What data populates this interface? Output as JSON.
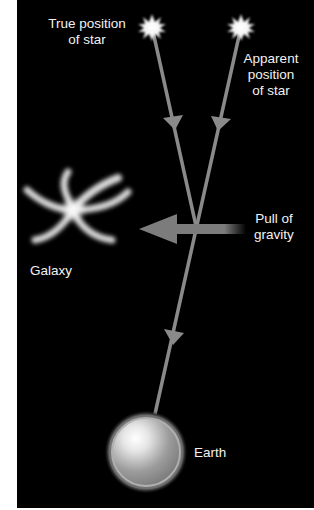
{
  "diagram": {
    "labels": {
      "true_star": [
        "True position",
        "of star"
      ],
      "apparent_star": [
        "Apparent",
        "position",
        "of star"
      ],
      "gravity": [
        "Pull of",
        "gravity"
      ],
      "galaxy": "Galaxy",
      "earth": "Earth"
    },
    "colors": {
      "background": "#000000",
      "margin": "#ffffff",
      "ray": "#8a8a8a",
      "text": "#f2f2f2",
      "star": "#ffffff"
    },
    "nodes": {
      "true_star": {
        "x": 152,
        "y": 27
      },
      "apparent_star": {
        "x": 241,
        "y": 27
      },
      "crossing": {
        "x": 196,
        "y": 226
      },
      "earth": {
        "x": 146,
        "y": 452,
        "r": 40
      },
      "galaxy": {
        "x": 73,
        "y": 210
      }
    }
  }
}
